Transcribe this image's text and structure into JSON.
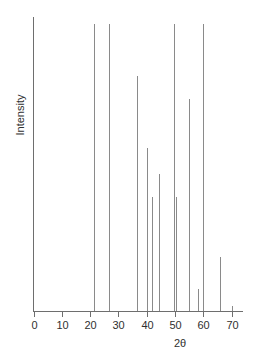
{
  "chart_data": {
    "type": "bar",
    "title": "",
    "subtitle": "",
    "xlabel": "2θ",
    "ylabel": "Intensity",
    "xlim": [
      0,
      74
    ],
    "ylim": [
      0,
      100
    ],
    "grid": false,
    "legend": null,
    "xticks": [
      0,
      10,
      20,
      30,
      40,
      50,
      60,
      70
    ],
    "xticklabels": [
      "0",
      "10",
      "20",
      "30",
      "40",
      "50",
      "60",
      "70"
    ],
    "yticks": [],
    "yticklabels": [],
    "x": [
      21.5,
      26.5,
      36.5,
      40.0,
      42.0,
      44.5,
      49.5,
      50.5,
      55.0,
      58.0,
      60.0,
      66.0,
      70.0
    ],
    "values": [
      100,
      100,
      82,
      57,
      40,
      48,
      100,
      40,
      74,
      8,
      100,
      19,
      2
    ],
    "annotations": []
  },
  "axes": {
    "y_axis_label": "Intensity",
    "x_axis_label": "2θ"
  }
}
